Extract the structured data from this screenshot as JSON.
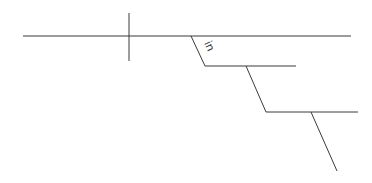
{
  "diagram": {
    "type": "sentence-diagram",
    "labels": {
      "preposition": "in"
    },
    "colors": {
      "line": "#3a3a3a",
      "text": "#333333",
      "background": "#ffffff"
    }
  }
}
